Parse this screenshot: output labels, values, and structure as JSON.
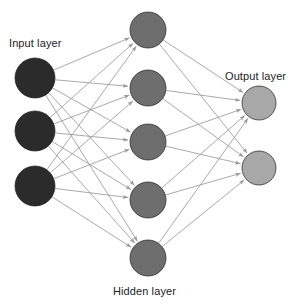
{
  "diagram": {
    "background_color": "#ffffff",
    "width": 296,
    "height": 305
  },
  "labels": {
    "input": "Input layer",
    "hidden": "Hidden layer",
    "output": "Output layer"
  },
  "colors": {
    "input_node": "#2b2b2b",
    "hidden_node": "#6e6e6e",
    "output_node": "#a8a8a8",
    "node_stroke": "#1f1f1f",
    "edge": "#9a9a9a",
    "arrowhead": "#9a9a9a",
    "label_text": "#1c1c1c",
    "background": "#ffffff"
  },
  "chart_data": {
    "type": "diagram",
    "layers": [
      {
        "name": "input",
        "label": "Input layer",
        "node_count": 3,
        "fill": "#2b2b2b",
        "radius": 20,
        "center_x": 35,
        "node_centers_y": [
          78,
          131,
          186
        ]
      },
      {
        "name": "hidden",
        "label": "Hidden layer",
        "node_count": 5,
        "fill": "#6e6e6e",
        "radius": 18,
        "center_x": 148,
        "node_centers_y": [
          30,
          88,
          142,
          200,
          258
        ]
      },
      {
        "name": "output",
        "label": "Output layer",
        "node_count": 2,
        "fill": "#a8a8a8",
        "radius": 17,
        "center_x": 259,
        "node_centers_y": [
          103,
          168
        ]
      }
    ],
    "connections": [
      {
        "from_layer": "input",
        "to_layer": "hidden",
        "fully_connected": true,
        "edge_count": 15,
        "directed": true
      },
      {
        "from_layer": "hidden",
        "to_layer": "output",
        "fully_connected": true,
        "edge_count": 10,
        "directed": true
      }
    ],
    "total_nodes": 10,
    "total_edges": 25,
    "grid": false,
    "legend": false
  }
}
